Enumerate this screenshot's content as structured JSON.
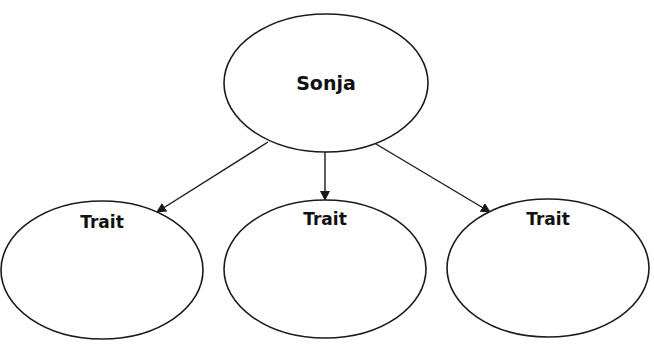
{
  "diagram": {
    "type": "web-organizer",
    "center": {
      "label": "Sonja"
    },
    "children": [
      {
        "label": "Trait"
      },
      {
        "label": "Trait"
      },
      {
        "label": "Trait"
      }
    ]
  },
  "colors": {
    "stroke": "#1a1a1a",
    "background": "#ffffff",
    "text": "#111111"
  }
}
